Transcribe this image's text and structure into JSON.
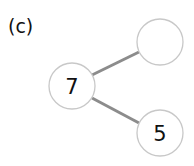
{
  "panel_label": "(c)",
  "colors": {
    "edge": "#8c8c8c",
    "node_stroke": "#c8c8c8",
    "node_fill": "#ffffff",
    "text": "#111111"
  },
  "nodes": [
    {
      "id": "root",
      "label": "7",
      "cx": 72,
      "cy": 86,
      "r": 23
    },
    {
      "id": "top-right",
      "label": "",
      "cx": 160,
      "cy": 42,
      "r": 23
    },
    {
      "id": "bottom-right",
      "label": "5",
      "cx": 160,
      "cy": 133,
      "r": 23
    }
  ],
  "edges": [
    {
      "from": "root",
      "to": "top-right"
    },
    {
      "from": "root",
      "to": "bottom-right"
    }
  ]
}
